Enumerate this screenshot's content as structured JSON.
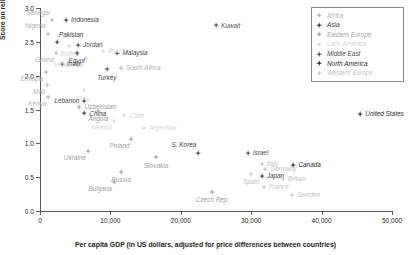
{
  "chart_data": {
    "type": "scatter",
    "title": "",
    "xlabel": "Per capita GDP (in US dollars, adjusted for price differences between countries)",
    "ylabel": "Score on religiosity scale",
    "xlim": [
      0,
      50000
    ],
    "ylim": [
      0.0,
      3.0
    ],
    "xticks": [
      0,
      10000,
      20000,
      30000,
      40000,
      50000
    ],
    "xtick_labels": [
      "0",
      "10,000",
      "20,000",
      "30,000",
      "40,000",
      "50,000"
    ],
    "yticks": [
      0.0,
      0.5,
      1.0,
      1.5,
      2.0,
      2.5,
      3.0
    ],
    "ytick_labels": [
      "0.0",
      "0.5",
      "1.0",
      "1.5",
      "2.0",
      "2.5",
      "3.0"
    ],
    "grid": false,
    "legend_position": "top-right",
    "series": [
      {
        "name": "Africa",
        "color": "#b4b4b4",
        "points": [
          {
            "label": "Senegal",
            "x": 1700,
            "y": 2.82,
            "pos": "lb-tl"
          },
          {
            "label": "Nigeria",
            "x": 1100,
            "y": 2.62,
            "pos": "lb-tl"
          },
          {
            "label": "Ghana",
            "x": 2300,
            "y": 2.33,
            "pos": "lb-bl"
          },
          {
            "label": "Ethiopia",
            "x": 800,
            "y": 2.05,
            "pos": "lb-bl"
          },
          {
            "label": "Mali",
            "x": 1000,
            "y": 1.86,
            "pos": "lb-bl"
          },
          {
            "label": "Kenya",
            "x": 1200,
            "y": 1.68,
            "pos": "lb-bl"
          },
          {
            "label": "South Africa",
            "x": 11500,
            "y": 2.11,
            "pos": "lb-r"
          }
        ]
      },
      {
        "name": "Asia",
        "color": "#3b3b3b",
        "points": [
          {
            "label": "Indonesia",
            "x": 3700,
            "y": 2.82,
            "pos": "lb-r"
          },
          {
            "label": "Pakistan",
            "x": 2400,
            "y": 2.49,
            "pos": "lb-tr"
          },
          {
            "label": "India",
            "x": 3100,
            "y": 2.17,
            "pos": "lb-r"
          },
          {
            "label": "Malaysia",
            "x": 11000,
            "y": 2.34,
            "pos": "lb-r"
          },
          {
            "label": "S. Korea",
            "x": 22500,
            "y": 0.86,
            "pos": "lb-tl"
          },
          {
            "label": "Japan",
            "x": 31500,
            "y": 0.52,
            "pos": "lb-r"
          },
          {
            "label": "China",
            "x": 6300,
            "y": 1.44,
            "pos": "lb-r"
          }
        ]
      },
      {
        "name": "Eastern Europe",
        "color": "#9d9d9d",
        "points": [
          {
            "label": "Poland",
            "x": 13000,
            "y": 1.06,
            "pos": "lb-bl"
          },
          {
            "label": "Slovakia",
            "x": 16500,
            "y": 0.79,
            "pos": "lb-b"
          },
          {
            "label": "Russia",
            "x": 11500,
            "y": 0.57,
            "pos": "lb-b"
          },
          {
            "label": "Bulgaria",
            "x": 10500,
            "y": 0.43,
            "pos": "lb-bl"
          },
          {
            "label": "Czech Rep.",
            "x": 24500,
            "y": 0.28,
            "pos": "lb-b"
          },
          {
            "label": "Ukraine",
            "x": 6800,
            "y": 0.88,
            "pos": "lb-bl"
          },
          {
            "label": "Angola",
            "x": 8300,
            "y": 1.48,
            "pos": "lb-b"
          },
          {
            "label": "Uzbekistan",
            "x": 5600,
            "y": 1.54,
            "pos": "lb-r"
          }
        ]
      },
      {
        "name": "Latin America",
        "color": "#d6d6d6",
        "points": [
          {
            "label": "Brazil",
            "x": 9000,
            "y": 2.36,
            "pos": "lb-r"
          },
          {
            "label": "Venezuela",
            "x": 6500,
            "y": 2.26,
            "pos": "lb-bl"
          },
          {
            "label": "Peru",
            "x": 6200,
            "y": 1.78,
            "pos": "lb-b"
          },
          {
            "label": "Chile",
            "x": 12000,
            "y": 1.41,
            "pos": "lb-r"
          },
          {
            "label": "Argentina",
            "x": 14800,
            "y": 1.22,
            "pos": "lb-r"
          },
          {
            "label": "Mexico",
            "x": 10500,
            "y": 1.33,
            "pos": "lb-bl"
          },
          {
            "label": "Bolivia",
            "x": 4200,
            "y": 2.44,
            "pos": "lb-b"
          }
        ]
      },
      {
        "name": "Middle East",
        "color": "#4a4a4a",
        "points": [
          {
            "label": "Kuwait",
            "x": 25000,
            "y": 2.74,
            "pos": "lb-r"
          },
          {
            "label": "Jordan",
            "x": 5400,
            "y": 2.45,
            "pos": "lb-r"
          },
          {
            "label": "Egypt",
            "x": 5200,
            "y": 2.34,
            "pos": "lb-b"
          },
          {
            "label": "Turkey",
            "x": 9500,
            "y": 2.09,
            "pos": "lb-b"
          },
          {
            "label": "Lebanon",
            "x": 6300,
            "y": 1.62,
            "pos": "lb-l"
          },
          {
            "label": "Israel",
            "x": 29500,
            "y": 0.85,
            "pos": "lb-r"
          }
        ]
      },
      {
        "name": "North America",
        "color": "#2b2b2b",
        "points": [
          {
            "label": "United States",
            "x": 45500,
            "y": 1.43,
            "pos": "lb-r"
          },
          {
            "label": "Canada",
            "x": 36000,
            "y": 0.68,
            "pos": "lb-r"
          }
        ]
      },
      {
        "name": "Western Europe",
        "color": "#c4c4c4",
        "points": [
          {
            "label": "Italy",
            "x": 31500,
            "y": 0.7,
            "pos": "lb-r"
          },
          {
            "label": "Germany",
            "x": 32000,
            "y": 0.62,
            "pos": "lb-r"
          },
          {
            "label": "Britain",
            "x": 34500,
            "y": 0.47,
            "pos": "lb-r"
          },
          {
            "label": "France",
            "x": 31800,
            "y": 0.36,
            "pos": "lb-r"
          },
          {
            "label": "Sweden",
            "x": 35800,
            "y": 0.24,
            "pos": "lb-r"
          },
          {
            "label": "Spain",
            "x": 30000,
            "y": 0.55,
            "pos": "lb-b"
          }
        ]
      }
    ]
  }
}
